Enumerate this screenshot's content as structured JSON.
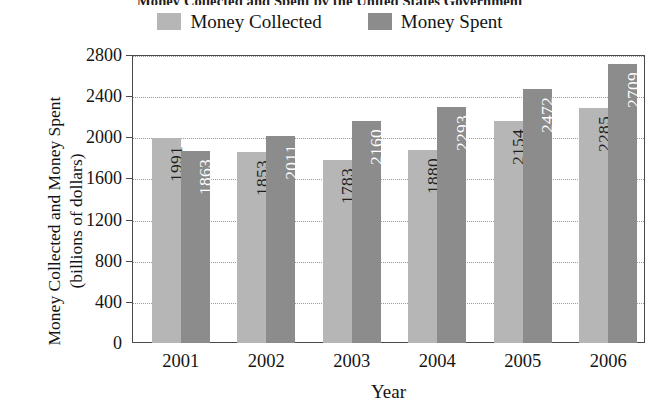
{
  "chart_data": {
    "type": "bar",
    "title": "Money Collected and Spent by the United States Government",
    "xlabel": "Year",
    "ylabel": "Money Collected and Money Spent (billions of dollars)",
    "categories": [
      "2001",
      "2002",
      "2003",
      "2004",
      "2005",
      "2006"
    ],
    "series": [
      {
        "name": "Money Collected",
        "color": "#b6b6b6",
        "values": [
          1991,
          1853,
          1783,
          1880,
          2154,
          2285
        ]
      },
      {
        "name": "Money Spent",
        "color": "#8c8c8c",
        "values": [
          1863,
          2011,
          2160,
          2293,
          2472,
          2709
        ]
      }
    ],
    "ylim": [
      0,
      2800
    ],
    "yticks": [
      0,
      400,
      800,
      1200,
      1600,
      2000,
      2400,
      2800
    ],
    "ytick_labels": [
      "0",
      "400",
      "800",
      "1200",
      "1600",
      "2000",
      "2400",
      "2800"
    ],
    "grid": true,
    "grid_style": "dotted-horizontal",
    "legend_position": "top-center",
    "bar_value_labels": true,
    "bar_value_label_orientation": "vertical"
  },
  "legend": {
    "entries": [
      {
        "label": "Money Collected",
        "color": "#b6b6b6"
      },
      {
        "label": "Money Spent",
        "color": "#8c8c8c"
      }
    ]
  },
  "axes": {
    "y_title": "Money Collected and Money Spent (billions of dollars)",
    "x_title": "Year"
  }
}
